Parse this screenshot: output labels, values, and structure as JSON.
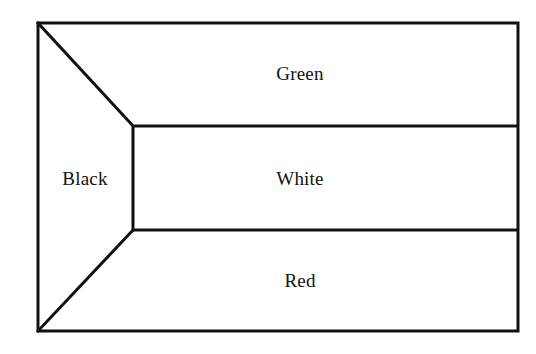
{
  "figure": {
    "type": "flag-schematic-diagram",
    "caption": "",
    "canvas": {
      "width": 536,
      "height": 354
    },
    "style": {
      "background_color": "#ffffff",
      "fill_color": "#ffffff",
      "stroke_color": "#111111",
      "stroke_width_px": 3,
      "text_color": "#111111"
    },
    "outline": {
      "name": "flag-border",
      "top_left": [
        38,
        23
      ],
      "top_right": [
        518,
        23
      ],
      "bottom_right": [
        518,
        331
      ],
      "bottom_left": [
        38,
        331
      ]
    },
    "vertices": {
      "hoist_top": [
        38,
        23
      ],
      "hoist_bottom": [
        38,
        331
      ],
      "inner_top": [
        133,
        126
      ],
      "inner_bottom": [
        133,
        230
      ],
      "fly_top": [
        518,
        23
      ],
      "fly_upper_mid": [
        518,
        126
      ],
      "fly_lower_mid": [
        518,
        230
      ],
      "fly_bottom": [
        518,
        331
      ]
    },
    "regions": [
      {
        "id": "green-band",
        "label": "Green",
        "shape": "quadrilateral",
        "points": [
          [
            38,
            23
          ],
          [
            518,
            23
          ],
          [
            518,
            126
          ],
          [
            133,
            126
          ]
        ],
        "label_position": [
          300,
          73
        ],
        "fill": "#ffffff"
      },
      {
        "id": "white-band",
        "label": "White",
        "shape": "rectangle",
        "points": [
          [
            133,
            126
          ],
          [
            518,
            126
          ],
          [
            518,
            230
          ],
          [
            133,
            230
          ]
        ],
        "label_position": [
          300,
          178
        ],
        "fill": "#ffffff"
      },
      {
        "id": "red-band",
        "label": "Red",
        "shape": "quadrilateral",
        "points": [
          [
            133,
            230
          ],
          [
            518,
            230
          ],
          [
            518,
            331
          ],
          [
            38,
            331
          ]
        ],
        "label_position": [
          300,
          280
        ],
        "fill": "#ffffff"
      },
      {
        "id": "black-hoist",
        "label": "Black",
        "shape": "trapezoid",
        "points": [
          [
            38,
            23
          ],
          [
            133,
            126
          ],
          [
            133,
            230
          ],
          [
            38,
            331
          ]
        ],
        "label_position": [
          85,
          178
        ],
        "fill": "#ffffff"
      }
    ],
    "internal_lines": [
      {
        "id": "diagonal-upper",
        "from": [
          38,
          23
        ],
        "to": [
          133,
          126
        ]
      },
      {
        "id": "diagonal-lower",
        "from": [
          38,
          331
        ],
        "to": [
          133,
          230
        ]
      },
      {
        "id": "hoist-vertical",
        "from": [
          133,
          126
        ],
        "to": [
          133,
          230
        ]
      },
      {
        "id": "stripe-divider-upper",
        "from": [
          133,
          126
        ],
        "to": [
          518,
          126
        ]
      },
      {
        "id": "stripe-divider-lower",
        "from": [
          133,
          230
        ],
        "to": [
          518,
          230
        ]
      }
    ]
  }
}
